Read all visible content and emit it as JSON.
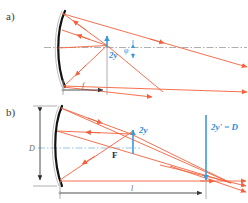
{
  "figure": {
    "background_color": "#ffffff",
    "width": 248,
    "height": 203
  },
  "colors": {
    "ray": "#f4613c",
    "blue": "#3d9ada",
    "blue_label": "#2f8fd8",
    "axis_gray": "#9a9a9a",
    "axis_blue": "#7fb8e0",
    "mirror": "#111111",
    "mirror_back": "#b5b5b5",
    "dim_line": "#9a9a9a",
    "text_dark": "#3a3a3a"
  },
  "panels": [
    {
      "id": "a",
      "label": "a)",
      "description": "Off-axis parallel bundle reflected by concave mirror forming image of height 2y at focal plane",
      "annotations": [
        {
          "name": "image-height",
          "text": "2y",
          "color": "#2f8fd8",
          "style": "italic-bold"
        },
        {
          "name": "field-angle",
          "text": "φ",
          "color": "#2f8fd8",
          "style": "italic"
        },
        {
          "name": "focal-length",
          "text": "f",
          "color": "#6b6b6b",
          "style": "italic"
        }
      ]
    },
    {
      "id": "b",
      "label": "b)",
      "description": "Reverse ray path: source of size 2y at focus projected to aperture D at distance l",
      "annotations": [
        {
          "name": "aperture-diameter",
          "text": "D",
          "color": "#6b6b6b",
          "style": "italic"
        },
        {
          "name": "object-height",
          "text": "2y",
          "color": "#2f8fd8",
          "style": "italic-bold"
        },
        {
          "name": "focal-point",
          "text": "F",
          "color": "#2b2b2b",
          "style": "bold"
        },
        {
          "name": "projected-height",
          "text": "2y' = D",
          "color": "#2f8fd8",
          "style": "italic-bold"
        },
        {
          "name": "projection-distance",
          "text": "l",
          "color": "#6b6b6b",
          "style": "italic"
        }
      ]
    }
  ],
  "labels": {
    "panel_a": "a)",
    "panel_b": "b)",
    "two_y_a": "2y",
    "phi": "φ",
    "f": "f",
    "D": "D",
    "two_y_b": "2y",
    "F": "F",
    "two_y_prime": "2y' = D",
    "l": "l"
  }
}
